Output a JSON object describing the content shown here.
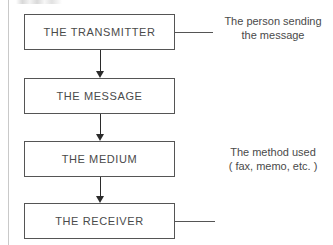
{
  "diagram": {
    "type": "flowchart",
    "orientation": "vertical",
    "colors": {
      "background": "#ffffff",
      "box_border": "#555555",
      "box_fill": "#ffffff",
      "text": "#4a4a4a",
      "arrow": "#2b2b2b",
      "margin_rule": "#c9c9c9"
    },
    "nodes": [
      {
        "id": "transmitter",
        "label": "THE TRANSMITTER"
      },
      {
        "id": "message",
        "label": "THE MESSAGE"
      },
      {
        "id": "medium",
        "label": "THE MEDIUM"
      },
      {
        "id": "receiver",
        "label": "THE RECEIVER"
      }
    ],
    "annotations": [
      {
        "id": "transmitter-note",
        "attached_to": "transmitter",
        "line1": "The person sending",
        "line2": "the message"
      },
      {
        "id": "medium-note",
        "attached_to": "medium",
        "line1": "The method used",
        "line2": "( fax, memo, etc. )"
      }
    ],
    "connectors": [
      {
        "from": "transmitter",
        "to": "message",
        "style": "arrow-down"
      },
      {
        "from": "message",
        "to": "medium",
        "style": "arrow-down"
      },
      {
        "from": "medium",
        "to": "receiver",
        "style": "arrow-down"
      },
      {
        "from": "transmitter",
        "to": "transmitter-note",
        "style": "leader-line"
      },
      {
        "from": "receiver",
        "to": "receiver-note",
        "style": "leader-line"
      }
    ]
  }
}
